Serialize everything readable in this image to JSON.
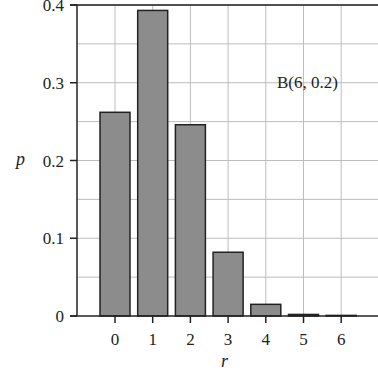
{
  "chart_data": {
    "type": "bar",
    "title": "",
    "annotation": "B(6, 0.2)",
    "xlabel": "r",
    "ylabel": "p",
    "categories": [
      "0",
      "1",
      "2",
      "3",
      "4",
      "5",
      "6"
    ],
    "values": [
      0.262,
      0.393,
      0.246,
      0.082,
      0.015,
      0.002,
      0.0001
    ],
    "ylim": [
      0,
      0.4
    ],
    "yticks": [
      "0",
      "0.1",
      "0.2",
      "0.3",
      "0.4"
    ],
    "grid": true,
    "colors": {
      "bar": "#8c8c8c",
      "bar_edge": "#222222",
      "grid": "#bdbdbd",
      "axis": "#222222"
    }
  }
}
